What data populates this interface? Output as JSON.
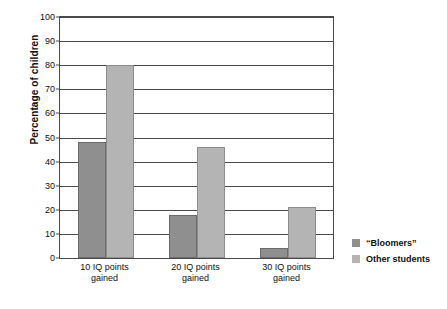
{
  "chart_data": {
    "type": "bar",
    "title": "",
    "subtitle": "",
    "xlabel": "",
    "ylabel": "Percentage of children",
    "categories": [
      "10 IQ points gained",
      "20 IQ points gained",
      "30 IQ points gained"
    ],
    "category_lines": [
      {
        "line1": "10 IQ points",
        "line2": "gained"
      },
      {
        "line1": "20 IQ points",
        "line2": "gained"
      },
      {
        "line1": "30 IQ points",
        "line2": "gained"
      }
    ],
    "series": [
      {
        "name": "“Bloomers”",
        "color": "#8f8f8f",
        "values": [
          48,
          18,
          4
        ]
      },
      {
        "name": "Other students",
        "color": "#b4b4b4",
        "values": [
          80,
          46,
          21
        ]
      }
    ],
    "ylim": [
      0,
      100
    ],
    "ytick_step": 10,
    "yticks": [
      0,
      10,
      20,
      30,
      40,
      50,
      60,
      70,
      80,
      90,
      100
    ],
    "ytick_labels": [
      "0",
      "10",
      "20",
      "30",
      "40",
      "50",
      "60",
      "70",
      "80",
      "90",
      "100"
    ],
    "grid": true,
    "grid_axis": "y",
    "legend_position": "right",
    "legend": [
      "“Bloomers”",
      "Other students"
    ],
    "axis_color": "#4a4a4a",
    "background": "#ffffff"
  }
}
